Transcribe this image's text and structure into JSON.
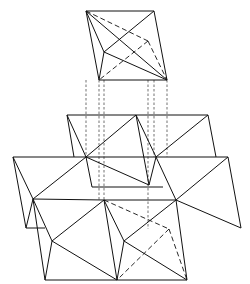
{
  "diagram": {
    "stroke_color": "#111111",
    "background": "#ffffff",
    "solid_lines": [
      [
        86,
        11,
        154,
        11
      ],
      [
        99,
        80,
        167,
        80
      ],
      [
        86,
        11,
        99,
        80
      ],
      [
        154,
        11,
        167,
        80
      ],
      [
        86,
        11,
        104,
        52
      ],
      [
        104,
        52,
        99,
        80
      ],
      [
        104,
        52,
        167,
        80
      ],
      [
        104,
        52,
        154,
        11
      ],
      [
        86,
        11,
        167,
        80
      ],
      [
        67,
        115,
        208,
        115
      ],
      [
        67,
        115,
        86,
        157
      ],
      [
        67,
        115,
        74,
        157
      ],
      [
        86,
        157,
        136,
        115
      ],
      [
        136,
        115,
        156,
        157
      ],
      [
        136,
        115,
        149,
        185
      ],
      [
        86,
        157,
        149,
        185
      ],
      [
        156,
        157,
        149,
        185
      ],
      [
        208,
        115,
        216,
        157
      ],
      [
        156,
        157,
        208,
        115
      ],
      [
        13,
        157,
        228,
        157
      ],
      [
        13,
        157,
        33,
        199
      ],
      [
        13,
        157,
        26,
        228
      ],
      [
        26,
        228,
        33,
        199
      ],
      [
        33,
        199,
        86,
        157
      ],
      [
        86,
        157,
        92,
        187
      ],
      [
        92,
        187,
        163,
        187
      ],
      [
        156,
        157,
        176,
        200
      ],
      [
        176,
        200,
        228,
        157
      ],
      [
        228,
        157,
        241,
        228
      ],
      [
        176,
        200,
        241,
        228
      ],
      [
        33,
        199,
        45,
        280
      ],
      [
        33,
        199,
        52,
        241
      ],
      [
        52,
        241,
        45,
        280
      ],
      [
        52,
        241,
        117,
        280
      ],
      [
        52,
        241,
        104,
        200
      ],
      [
        33,
        199,
        104,
        200
      ],
      [
        104,
        200,
        117,
        280
      ],
      [
        104,
        200,
        124,
        241
      ],
      [
        124,
        241,
        117,
        280
      ],
      [
        124,
        241,
        187,
        280
      ],
      [
        124,
        241,
        176,
        200
      ],
      [
        45,
        280,
        187,
        280
      ],
      [
        176,
        200,
        187,
        280
      ],
      [
        104,
        200,
        176,
        200
      ],
      [
        26,
        228,
        45,
        228
      ]
    ],
    "hidden_lines": [
      [
        86,
        11,
        148,
        41
      ],
      [
        148,
        41,
        167,
        80
      ],
      [
        148,
        41,
        99,
        80
      ],
      [
        104,
        200,
        169,
        229
      ],
      [
        169,
        229,
        187,
        280
      ],
      [
        169,
        229,
        117,
        280
      ]
    ],
    "projection_lines": [
      [
        86,
        80,
        86,
        157
      ],
      [
        99,
        80,
        99,
        200
      ],
      [
        104,
        80,
        104,
        200
      ],
      [
        148,
        80,
        148,
        229
      ],
      [
        154,
        80,
        154,
        157
      ],
      [
        167,
        80,
        167,
        157
      ]
    ]
  }
}
